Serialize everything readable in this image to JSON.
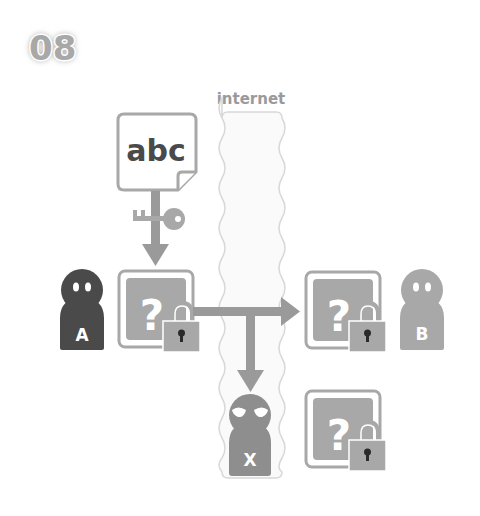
{
  "step_number": "08",
  "internet_label": "internet",
  "document": {
    "text": "abc"
  },
  "actors": {
    "sender": {
      "label": "A",
      "color": "#4a4a4a"
    },
    "receiver": {
      "label": "B",
      "color": "#a8a8a8"
    },
    "eavesdropper": {
      "label": "X",
      "color": "#8e8e8e"
    }
  },
  "boxes": {
    "glyph": "?"
  },
  "colors": {
    "gray_dark": "#4a4a4a",
    "gray_mid": "#9a9a9a",
    "gray_light": "#c8c8c8",
    "cloud_fill": "#fafafa",
    "cloud_stroke": "#d8d8d8"
  }
}
